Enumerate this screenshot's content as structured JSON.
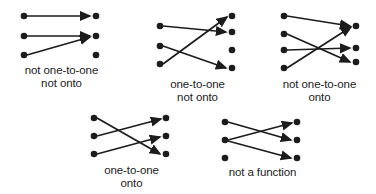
{
  "figure": {
    "background_color": "#ffffff",
    "ink_color": "#1c1c1c",
    "dot_color": "#1c1c1c"
  },
  "diagrams": [
    {
      "id": "not-one-to-one-not-onto",
      "caption_line1": "not one-to-one",
      "caption_line2": "not onto",
      "left_dot_count": 3,
      "right_dot_count": 3,
      "left_dots": [
        {
          "label": "L1",
          "x": 10,
          "y": 8
        },
        {
          "label": "L2",
          "x": 10,
          "y": 28
        },
        {
          "label": "L3",
          "x": 10,
          "y": 46
        }
      ],
      "right_dots": [
        {
          "label": "R1",
          "x": 82,
          "y": 8
        },
        {
          "label": "R2",
          "x": 82,
          "y": 28
        },
        {
          "label": "R3",
          "x": 82,
          "y": 46
        }
      ],
      "arrows": [
        {
          "from": "L1",
          "to": "R1"
        },
        {
          "from": "L2",
          "to": "R2"
        },
        {
          "from": "L3",
          "to": "R2"
        }
      ],
      "unmapped_targets": [
        "R3"
      ]
    },
    {
      "id": "one-to-one-not-onto",
      "caption_line1": "one-to-one",
      "caption_line2": "not onto",
      "left_dot_count": 3,
      "right_dot_count": 4,
      "left_dots": [
        {
          "label": "L1",
          "x": 10,
          "y": 18
        },
        {
          "label": "L2",
          "x": 10,
          "y": 38
        },
        {
          "label": "L3",
          "x": 10,
          "y": 56
        }
      ],
      "right_dots": [
        {
          "label": "R1",
          "x": 82,
          "y": 8
        },
        {
          "label": "R2",
          "x": 82,
          "y": 24
        },
        {
          "label": "R3",
          "x": 82,
          "y": 42
        },
        {
          "label": "R4",
          "x": 82,
          "y": 60
        }
      ],
      "arrows": [
        {
          "from": "L1",
          "to": "R2"
        },
        {
          "from": "L2",
          "to": "R4"
        },
        {
          "from": "L3",
          "to": "R1"
        }
      ],
      "unmapped_targets": [
        "R3"
      ]
    },
    {
      "id": "not-one-to-one-onto",
      "caption_line1": "not one-to-one",
      "caption_line2": "onto",
      "left_dot_count": 4,
      "right_dot_count": 3,
      "left_dots": [
        {
          "label": "L1",
          "x": 10,
          "y": 8
        },
        {
          "label": "L2",
          "x": 10,
          "y": 26
        },
        {
          "label": "L3",
          "x": 10,
          "y": 42
        },
        {
          "label": "L4",
          "x": 10,
          "y": 60
        }
      ],
      "right_dots": [
        {
          "label": "R1",
          "x": 82,
          "y": 18
        },
        {
          "label": "R2",
          "x": 82,
          "y": 40
        },
        {
          "label": "R3",
          "x": 82,
          "y": 54
        }
      ],
      "arrows": [
        {
          "from": "L1",
          "to": "R1"
        },
        {
          "from": "L2",
          "to": "R3"
        },
        {
          "from": "L3",
          "to": "R2"
        },
        {
          "from": "L4",
          "to": "R1"
        }
      ],
      "unmapped_targets": []
    },
    {
      "id": "one-to-one-onto",
      "caption_line1": "one-to-one",
      "caption_line2": "onto",
      "left_dot_count": 3,
      "right_dot_count": 3,
      "left_dots": [
        {
          "label": "L1",
          "x": 10,
          "y": 8
        },
        {
          "label": "L2",
          "x": 10,
          "y": 26
        },
        {
          "label": "L3",
          "x": 10,
          "y": 44
        }
      ],
      "right_dots": [
        {
          "label": "R1",
          "x": 82,
          "y": 8
        },
        {
          "label": "R2",
          "x": 82,
          "y": 26
        },
        {
          "label": "R3",
          "x": 82,
          "y": 44
        }
      ],
      "arrows": [
        {
          "from": "L1",
          "to": "R3"
        },
        {
          "from": "L2",
          "to": "R1"
        },
        {
          "from": "L3",
          "to": "R2"
        }
      ],
      "unmapped_targets": []
    },
    {
      "id": "not-a-function",
      "caption_line1": "not a function",
      "caption_line2": "",
      "left_dot_count": 3,
      "right_dot_count": 3,
      "left_dots": [
        {
          "label": "L1",
          "x": 10,
          "y": 8
        },
        {
          "label": "L2",
          "x": 10,
          "y": 26
        },
        {
          "label": "L3",
          "x": 10,
          "y": 44
        }
      ],
      "right_dots": [
        {
          "label": "R1",
          "x": 82,
          "y": 8
        },
        {
          "label": "R2",
          "x": 82,
          "y": 26
        },
        {
          "label": "R3",
          "x": 82,
          "y": 44
        }
      ],
      "arrows": [
        {
          "from": "L2",
          "to": "R1"
        },
        {
          "from": "L1",
          "to": "R2"
        },
        {
          "from": "L2",
          "to": "R3"
        }
      ],
      "unmapped_targets": []
    }
  ]
}
